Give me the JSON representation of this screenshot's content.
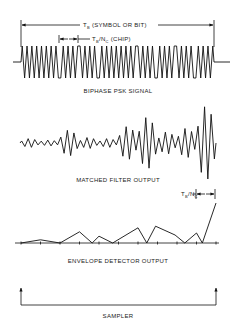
{
  "annotations": {
    "bit_period": {
      "main": "T",
      "sub": "B",
      "suffix": " (SYMBOL OR BIT)"
    },
    "chip_period": {
      "main": "T",
      "sub": "B",
      "slash": "/N",
      "sub2": "C",
      "suffix": " (CHIP)"
    },
    "chip_period_right": {
      "main": "T",
      "sub": "B",
      "slash": "/N",
      "sub2": "C"
    }
  },
  "panels": [
    {
      "id": "psk",
      "caption": "BIPHASE PSK SIGNAL"
    },
    {
      "id": "matched",
      "caption": "MATCHED FILTER OUTPUT"
    },
    {
      "id": "envelope",
      "caption": "ENVELOPE DETECTOR OUTPUT"
    },
    {
      "id": "sampler",
      "caption": "SAMPLER"
    }
  ],
  "signal": {
    "chips_per_bit": 10,
    "cycles_per_chip": 4,
    "phase_pattern": [
      1,
      1,
      -1,
      1,
      -1,
      -1,
      1,
      -1,
      1,
      -1
    ]
  },
  "matched_filter": {
    "envelope_per_chip": [
      0.12,
      0.08,
      0.35,
      0.15,
      0.12,
      0.45,
      0.7,
      0.3,
      0.4,
      1.0
    ]
  },
  "envelope_detector": {
    "points": [
      0,
      0.08,
      0,
      0.28,
      0,
      0.17,
      0,
      0.38,
      0,
      0.42,
      0.2,
      0,
      0.25,
      0,
      1.0
    ],
    "positions": [
      0,
      1,
      2,
      3,
      3.65,
      4,
      4.7,
      6,
      6.45,
      6.9,
      7.9,
      8.4,
      9,
      9.3,
      10
    ],
    "ticks": 11
  }
}
